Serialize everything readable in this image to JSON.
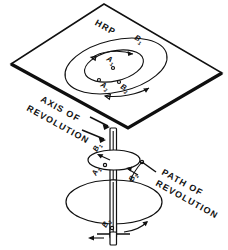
{
  "figure": {
    "plane_label": "HRP",
    "labels": {
      "axis_of_revolution": "AXIS OF REVOLUTION",
      "axis_line1": "AXIS OF",
      "axis_line2": "REVOLUTION",
      "path_of_revolution": "PATH OF REVOLUTION",
      "path_line1": "PATH OF",
      "path_line2": "REVOLUTION"
    },
    "points": {
      "b_top": {
        "letter": "B",
        "sub": "1"
      },
      "a_top": {
        "letter": "A",
        "sub": "1"
      },
      "a_bottom": {
        "letter": "A",
        "sub": "2"
      },
      "b_bottom": {
        "letter": "B",
        "sub": "2"
      },
      "disk_a": {
        "letter": "A",
        "sub": "1"
      },
      "disk_b_upper": {
        "letter": "B",
        "sub": "1"
      },
      "disk_b_right": {
        "letter": "B",
        "sub": "2"
      },
      "disk_b_lower": {
        "letter": "B",
        "sub": "2"
      }
    },
    "colors": {
      "ink": "#101010",
      "paper": "#ffffff"
    }
  }
}
